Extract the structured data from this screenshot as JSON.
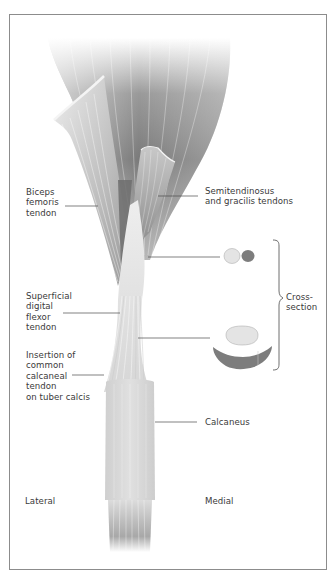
{
  "figure": {
    "type": "anatomical-illustration",
    "labels": {
      "biceps_femoris": "Biceps\nfemoris\ntendon",
      "semitendinosus_gracilis": "Semitendinosus\nand gracilis tendons",
      "superficial_digital_flexor": "Superficial\ndigital\nflexor\ntendon",
      "insertion": "Insertion of\ncommon\ncalcaneal\ntendon\non tuber calcis",
      "cross_section": "Cross-\nsection",
      "calcaneus": "Calcaneus",
      "lateral": "Lateral",
      "medial": "Medial"
    },
    "colors": {
      "frame": "#8c8c8c",
      "muscle_dark": "#6e6e6e",
      "muscle_light": "#e6e6e6",
      "tendon_light": "#d9d9d9",
      "tendon_dark": "#7a7a7a",
      "leader_line": "#4a4a4a",
      "cross_section_light": "#e4e4e4",
      "cross_section_dark": "#7d7d7d",
      "text": "#3a3a3a"
    }
  }
}
